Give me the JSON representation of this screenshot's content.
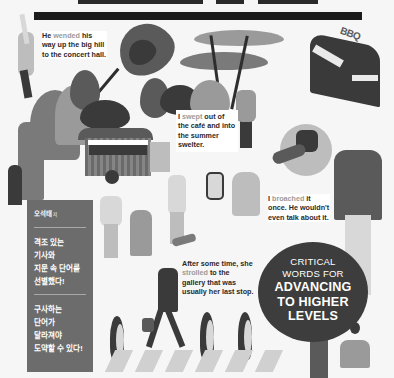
{
  "cover": {
    "background": "#f6f6f6",
    "accent_dark": "#3d3d3d",
    "panel_color": "#6c6c6c"
  },
  "captions": [
    {
      "id": "wended",
      "before": "He ",
      "highlight": "wended",
      "after": " his way up the big hill to the concert hall."
    },
    {
      "id": "swept",
      "before": "I ",
      "highlight": "swept",
      "after": " out of the café and into the summer swelter."
    },
    {
      "id": "broached",
      "before": "I ",
      "highlight": "broached",
      "after": " it once. He wouldn't even talk about it."
    },
    {
      "id": "strolled",
      "before": "After some time, she ",
      "highlight": "strolled",
      "after": " to the gallery that was usually her last stop."
    }
  ],
  "side_panel": {
    "author": "오석태",
    "author_suffix": "저",
    "block1": [
      "격조 있는",
      "기사와",
      "지문 속 단어를",
      "선별했다!"
    ],
    "block2": [
      "구사하는",
      "단어가",
      "달라져야",
      "도약할 수 있다!"
    ]
  },
  "badge": {
    "line1": "CRITICAL",
    "line2": "WORDS FOR",
    "line3": "ADVANCING",
    "line4": "TO HIGHER",
    "line5": "LEVELS"
  },
  "sign": {
    "bbq": "BBQ"
  }
}
